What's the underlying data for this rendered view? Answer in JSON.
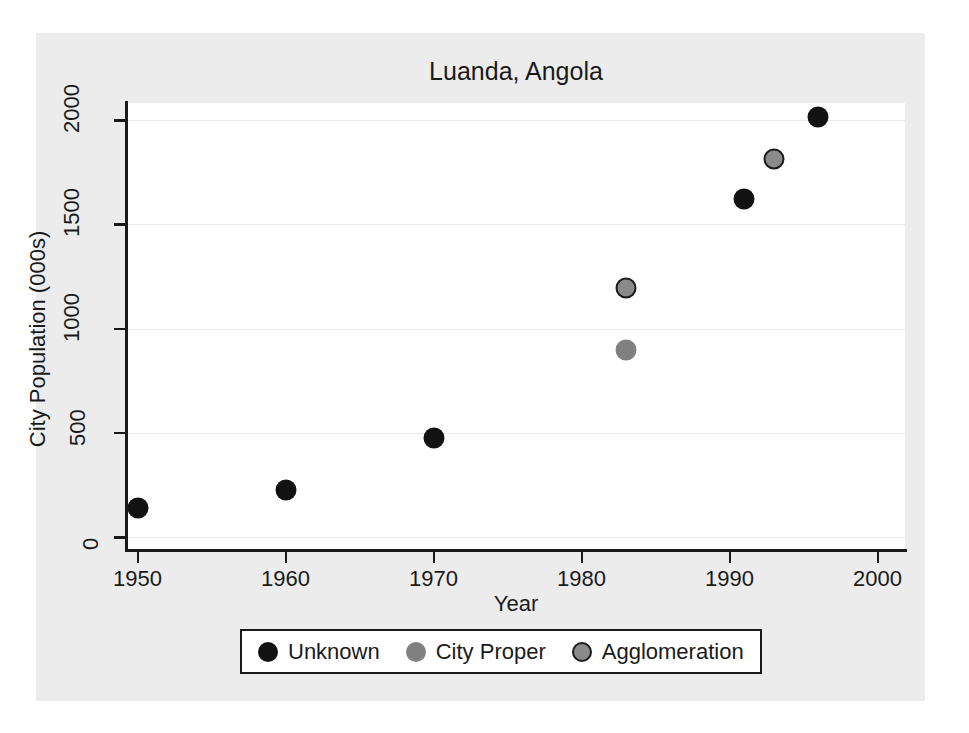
{
  "chart_data": {
    "type": "scatter",
    "title": "Luanda, Angola",
    "xlabel": "Year",
    "ylabel": "City Population (000s)",
    "xlim": [
      1948,
      2001
    ],
    "ylim": [
      0,
      2100
    ],
    "xticks": [
      1950,
      1960,
      1970,
      1980,
      1990,
      2000
    ],
    "xtick_labels": [
      "1950",
      "1960",
      "1970",
      "1980",
      "1990",
      "2000"
    ],
    "yticks": [
      0,
      500,
      1000,
      1500,
      2000
    ],
    "ytick_labels": [
      "0",
      "500",
      "1000",
      "1500",
      "2000"
    ],
    "grid": "horizontal",
    "legend_position": "bottom",
    "series": [
      {
        "name": "Unknown",
        "marker": "filled-circle",
        "color": "#121212",
        "points": [
          {
            "x": 1950,
            "y": 140
          },
          {
            "x": 1960,
            "y": 225
          },
          {
            "x": 1970,
            "y": 475
          },
          {
            "x": 1991,
            "y": 1620
          },
          {
            "x": 1996,
            "y": 2015
          }
        ]
      },
      {
        "name": "City Proper",
        "marker": "filled-circle",
        "color": "#808080",
        "points": [
          {
            "x": 1983,
            "y": 895
          }
        ]
      },
      {
        "name": "Agglomeration",
        "marker": "outlined-circle",
        "color": "#8a8a8a",
        "edge_color": "#1a1a1a",
        "points": [
          {
            "x": 1983,
            "y": 1195
          },
          {
            "x": 1993,
            "y": 1815
          }
        ]
      }
    ]
  },
  "legend": {
    "entries": [
      {
        "label": "Unknown"
      },
      {
        "label": "City Proper"
      },
      {
        "label": "Agglomeration"
      }
    ]
  },
  "colors": {
    "figure_background": "#ececec",
    "plot_background": "#ffffff",
    "gridline": "#e9e9e9",
    "axis": "#1a1a1a",
    "text": "#1a1a1a"
  }
}
